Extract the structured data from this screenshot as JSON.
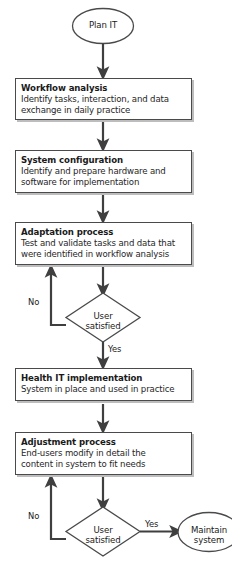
{
  "diagram": {
    "colors": {
      "stroke": "#4a4a4a",
      "arrow": "#3f3f3f",
      "text": "#1a1a1a",
      "shadow": "#bdbdbd",
      "background": "#ffffff"
    },
    "start": {
      "shape": "ellipse",
      "label": "Plan IT"
    },
    "end": {
      "shape": "ellipse",
      "label_line1": "Maintain",
      "label_line2": "system"
    },
    "processes": [
      {
        "id": "workflow-analysis",
        "title": "Workflow analysis",
        "body_line1": "Identify tasks, interaction, and data",
        "body_line2": "exchange in daily practice",
        "body_line3": ""
      },
      {
        "id": "system-configuration",
        "title": "System configuration",
        "body_line1": "Identify and prepare hardware and",
        "body_line2": "software for implementation",
        "body_line3": ""
      },
      {
        "id": "adaptation-process",
        "title": "Adaptation process",
        "body_line1": "Test and validate tasks and data that",
        "body_line2": "were identified in workflow analysis",
        "body_line3": ""
      },
      {
        "id": "health-it-implementation",
        "title": "Health IT implementation",
        "body_line1": "System in place and used in practice",
        "body_line2": "",
        "body_line3": ""
      },
      {
        "id": "adjustment-process",
        "title": "Adjustment process",
        "body_line1": "End-users modify in detail the",
        "body_line2": "content in system to fit needs",
        "body_line3": ""
      }
    ],
    "decisions": [
      {
        "id": "user-satisfied-1",
        "label_line1": "User",
        "label_line2": "satisfied",
        "no_label": "No",
        "yes_label": "Yes"
      },
      {
        "id": "user-satisfied-2",
        "label_line1": "User",
        "label_line2": "satisfied",
        "no_label": "No",
        "yes_label": "Yes"
      }
    ]
  }
}
